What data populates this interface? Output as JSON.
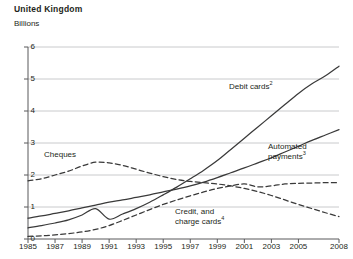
{
  "header": {
    "title": "United Kingdom",
    "units": "Billions"
  },
  "chart_data": {
    "type": "line",
    "title": "United Kingdom",
    "subtitle": "Billions",
    "xlabel": "",
    "ylabel": "Billions",
    "ylim": [
      0,
      6
    ],
    "xlim": [
      1985,
      2008
    ],
    "grid": true,
    "legend_position": "inline-annotations",
    "yticks": [
      "0",
      "1",
      "2",
      "3",
      "4",
      "5",
      "6"
    ],
    "xticks": [
      "1985",
      "1987",
      "1989",
      "1991",
      "1993",
      "1995",
      "1997",
      "1999",
      "2001",
      "2003",
      "2005",
      "2008"
    ],
    "x": [
      1985,
      1986,
      1987,
      1988,
      1989,
      1990,
      1991,
      1992,
      1993,
      1994,
      1995,
      1996,
      1997,
      1998,
      1999,
      2000,
      2001,
      2002,
      2003,
      2004,
      2005,
      2006,
      2007,
      2008
    ],
    "series": [
      {
        "name": "Debit cards",
        "footnote": "2",
        "style": "solid",
        "color": "#3a3a3a",
        "label_text": "Debit cards",
        "values": [
          0.35,
          0.42,
          0.5,
          0.6,
          0.75,
          0.95,
          0.62,
          0.78,
          0.95,
          1.15,
          1.38,
          1.62,
          1.88,
          2.15,
          2.45,
          2.8,
          3.15,
          3.5,
          3.85,
          4.2,
          4.55,
          4.85,
          5.1,
          5.4
        ]
      },
      {
        "name": "Automated payments",
        "footnote": "3",
        "style": "solid",
        "color": "#3a3a3a",
        "label_text": "Automated payments",
        "values": [
          0.65,
          0.72,
          0.8,
          0.88,
          0.97,
          1.06,
          1.15,
          1.22,
          1.3,
          1.38,
          1.47,
          1.56,
          1.66,
          1.78,
          1.92,
          2.07,
          2.22,
          2.38,
          2.54,
          2.72,
          2.9,
          3.08,
          3.25,
          3.42
        ]
      },
      {
        "name": "Credit, and charge cards",
        "footnote": "4",
        "style": "dashed",
        "color": "#3a3a3a",
        "label_text": "Credit, and charge cards",
        "values": [
          0.08,
          0.1,
          0.13,
          0.17,
          0.22,
          0.3,
          0.42,
          0.58,
          0.75,
          0.92,
          1.08,
          1.22,
          1.35,
          1.47,
          1.58,
          1.66,
          1.72,
          1.63,
          1.66,
          1.72,
          1.74,
          1.75,
          1.76,
          1.76
        ]
      },
      {
        "name": "Cheques",
        "footnote": "",
        "style": "dashed",
        "color": "#3a3a3a",
        "label_text": "Cheques",
        "values": [
          1.82,
          1.88,
          2.0,
          2.12,
          2.28,
          2.4,
          2.38,
          2.3,
          2.18,
          2.06,
          1.95,
          1.86,
          1.8,
          1.76,
          1.72,
          1.66,
          1.58,
          1.48,
          1.36,
          1.22,
          1.08,
          0.95,
          0.82,
          0.7
        ]
      }
    ],
    "annotations": [
      {
        "text": "Debit cards",
        "footnote": "2",
        "x": 229,
        "y": 82
      },
      {
        "text": "Automated",
        "footnote": "",
        "x": 268,
        "y": 142
      },
      {
        "text": "payments",
        "footnote": "3",
        "x": 268,
        "y": 152
      },
      {
        "text": "Credit, and",
        "footnote": "",
        "x": 175,
        "y": 207
      },
      {
        "text": "charge cards",
        "footnote": "4",
        "x": 175,
        "y": 217
      },
      {
        "text": "Cheques",
        "footnote": "",
        "x": 44,
        "y": 150
      }
    ]
  }
}
